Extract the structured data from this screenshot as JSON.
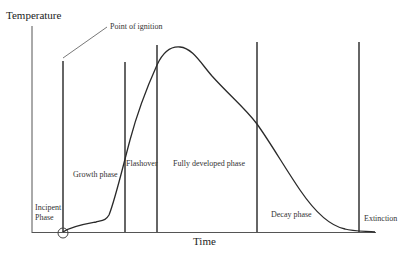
{
  "diagram": {
    "y_axis_label": "Temperature",
    "x_axis_label": "Time",
    "annotation": "Point of ignition",
    "phases": [
      {
        "label_line1": "Incipent",
        "label_line2": "Phase"
      },
      {
        "label_line1": "Growth phase",
        "label_line2": ""
      },
      {
        "label_line1": "Flashover",
        "label_line2": ""
      },
      {
        "label_line1": "Fully developed phase",
        "label_line2": ""
      },
      {
        "label_line1": "Decay phase",
        "label_line2": ""
      },
      {
        "label_line1": "Extinction",
        "label_line2": ""
      }
    ],
    "colors": {
      "line": "#444444",
      "curve": "#2a2a2a",
      "text": "#333333"
    }
  }
}
